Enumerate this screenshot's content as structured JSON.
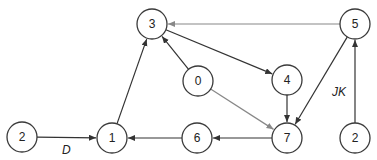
{
  "diagram": {
    "type": "directed-graph",
    "nodes": [
      {
        "id": "n2a",
        "label": "2",
        "x": 22,
        "y": 137
      },
      {
        "id": "n1",
        "label": "1",
        "x": 112,
        "y": 138
      },
      {
        "id": "n3",
        "label": "3",
        "x": 152,
        "y": 24
      },
      {
        "id": "n0",
        "label": "0",
        "x": 198,
        "y": 81
      },
      {
        "id": "n4",
        "label": "4",
        "x": 287,
        "y": 80
      },
      {
        "id": "n7",
        "label": "7",
        "x": 287,
        "y": 138
      },
      {
        "id": "n6",
        "label": "6",
        "x": 197,
        "y": 138
      },
      {
        "id": "n5",
        "label": "5",
        "x": 355,
        "y": 24
      },
      {
        "id": "n2b",
        "label": "2",
        "x": 355,
        "y": 138
      }
    ],
    "edges": [
      {
        "from": "n2a",
        "to": "n1",
        "label": "D",
        "color": "#333333"
      },
      {
        "from": "n1",
        "to": "n3",
        "label": "",
        "color": "#333333"
      },
      {
        "from": "n5",
        "to": "n3",
        "label": "",
        "color": "#888888"
      },
      {
        "from": "n3",
        "to": "n4",
        "label": "",
        "color": "#333333"
      },
      {
        "from": "n0",
        "to": "n3",
        "label": "",
        "color": "#333333"
      },
      {
        "from": "n0",
        "to": "n7",
        "label": "",
        "color": "#888888"
      },
      {
        "from": "n4",
        "to": "n7",
        "label": "",
        "color": "#333333"
      },
      {
        "from": "n5",
        "to": "n7",
        "label": "",
        "color": "#333333"
      },
      {
        "from": "n7",
        "to": "n6",
        "label": "",
        "color": "#333333"
      },
      {
        "from": "n6",
        "to": "n1",
        "label": "",
        "color": "#333333"
      },
      {
        "from": "n2b",
        "to": "n5",
        "label": "JK",
        "color": "#333333"
      }
    ]
  }
}
